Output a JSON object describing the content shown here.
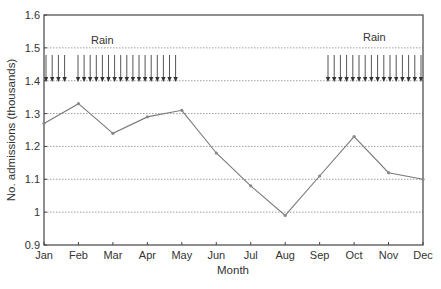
{
  "chart_data": {
    "type": "line",
    "title": "",
    "xlabel": "Month",
    "ylabel": "No. admissions (thousands)",
    "categories": [
      "Jan",
      "Feb",
      "Mar",
      "Apr",
      "May",
      "Jun",
      "Jul",
      "Aug",
      "Sep",
      "Oct",
      "Nov",
      "Dec"
    ],
    "series": [
      {
        "name": "Admissions",
        "values": [
          1.27,
          1.33,
          1.24,
          1.29,
          1.31,
          1.18,
          1.08,
          0.99,
          1.11,
          1.23,
          1.12,
          1.1
        ],
        "color": "#7a7a7a"
      }
    ],
    "ylim": [
      0.9,
      1.6
    ],
    "yticks": [
      "0.9",
      "1",
      "1.1",
      "1.2",
      "1.3",
      "1.4",
      "1.5",
      "1.6"
    ],
    "grid": "horizontal dotted",
    "legend": null,
    "annotations": [
      {
        "text": "Rain",
        "group": "left",
        "arrows": 21,
        "description": "Rain arrows spanning Jan to May (4 arrows, gap, 17 arrows)"
      },
      {
        "text": "Rain",
        "group": "right",
        "arrows": 16,
        "description": "Rain arrows spanning Sep to Dec"
      }
    ]
  },
  "labels": {
    "xlabel": "Month",
    "ylabel": "No. admissions (thousands)",
    "rain_left": "Rain",
    "rain_right": "Rain"
  }
}
